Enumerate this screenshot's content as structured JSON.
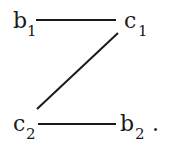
{
  "diagram": {
    "nodes": [
      {
        "id": "b1",
        "base": "b",
        "sub": "1"
      },
      {
        "id": "c1",
        "base": "c",
        "sub": "1"
      },
      {
        "id": "c2",
        "base": "c",
        "sub": "2"
      },
      {
        "id": "b2",
        "base": "b",
        "sub": "2"
      }
    ],
    "edges": [
      {
        "from": "b1",
        "to": "c1"
      },
      {
        "from": "c1",
        "to": "c2"
      },
      {
        "from": "c2",
        "to": "b2"
      }
    ],
    "trailing_punctuation": "."
  }
}
